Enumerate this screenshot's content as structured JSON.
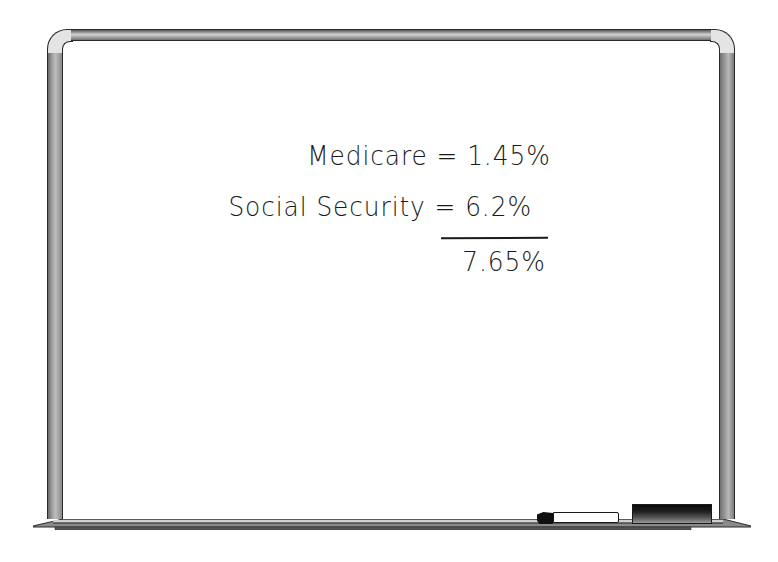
{
  "whiteboard": {
    "lines": [
      {
        "label": "Medicare",
        "operator": "=",
        "value": "1.45%"
      },
      {
        "label": "Social Security",
        "operator": "=",
        "value": "6.2%"
      }
    ],
    "total": "7.65%"
  },
  "tray": {
    "items": [
      "marker",
      "eraser"
    ]
  },
  "colors": {
    "ink": "#1a1a1a",
    "frame": "#a0a0a0",
    "board": "#ffffff",
    "eraser": "#111111"
  }
}
